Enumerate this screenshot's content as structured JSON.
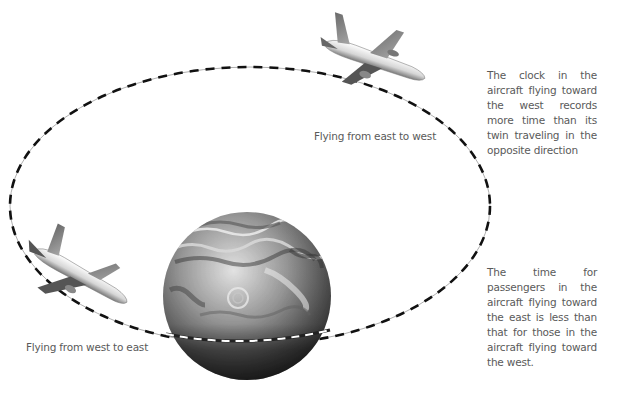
{
  "diagram": {
    "topic": "Time dilation for clocks on aircraft circling the Earth",
    "labels": {
      "east_to_west": "Flying from east to west",
      "west_to_east": "Flying from west to east"
    },
    "notes": {
      "west_clock": "The clock in the aircraft flying toward the west records more time than its twin traveling in the opposite direction",
      "east_time": "The time for passengers in the aircraft flying toward the east is less than that for those in the aircraft flying toward the west."
    },
    "elements": {
      "orbit": "dashed elliptical flight path around the globe",
      "globe": "Earth globe with clouds",
      "plane_top": "aircraft flying from east to west",
      "plane_left": "aircraft flying from west to east"
    },
    "colors": {
      "path_dash": "#111111",
      "path_line": "#9a9a9a",
      "text": "#5a5a5a",
      "background": "#ffffff"
    }
  }
}
